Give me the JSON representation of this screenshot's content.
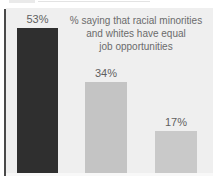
{
  "window": {
    "width": 213,
    "height": 176
  },
  "colors": {
    "page_bg": "#ffffff",
    "panel_bg": "#efefef",
    "axis_line": "#4a4a4a",
    "bar_dark": "#2f2f2f",
    "bar_mid": "#c4c4c4",
    "bar_light": "#c9c9c9",
    "label_text": "#5f5f5f",
    "title_text": "#6b6b6b"
  },
  "chart_data": {
    "type": "bar",
    "title": "% saying that racial minorities and whites have equal job opportunities",
    "title_display": "% saying that racial minorities\nand whites have equal\njob opportunities",
    "values": [
      53,
      34,
      17
    ],
    "value_labels": [
      "53%",
      "34%",
      "17%"
    ],
    "bar_colors": [
      "#2f2f2f",
      "#c4c4c4",
      "#c9c9c9"
    ],
    "layout_hints": {
      "legend": "none",
      "grid": "off",
      "axis": "left vertical axis line only; baseline and category labels cropped out of frame",
      "value_labels_position": "above bars"
    }
  }
}
